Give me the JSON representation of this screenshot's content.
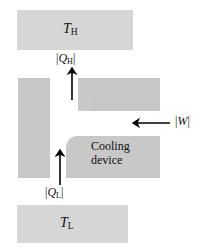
{
  "figure": {
    "type": "thermodynamics-schematic",
    "background_color": "#ffffff",
    "block_color": "#c8c8c8",
    "reservoir_color": "#d6d6d6",
    "channel_color": "#ffffff",
    "arrow_color": "#000000"
  },
  "reservoirs": {
    "hot": {
      "symbol": "T",
      "subscript": "H",
      "name": "hot-reservoir",
      "x": 17,
      "y": 10,
      "width": 116,
      "height": 40
    },
    "cold": {
      "symbol": "T",
      "subscript": "L",
      "name": "cold-reservoir",
      "x": 17,
      "y": 205,
      "width": 111,
      "height": 38
    }
  },
  "flows": {
    "heat_rejected": {
      "bar_open": "|",
      "symbol": "Q",
      "subscript": "H",
      "bar_close": "|",
      "direction": "up",
      "arrow_x": 72,
      "arrow_y_start": 100,
      "arrow_y_end": 68
    },
    "heat_absorbed": {
      "bar_open": "|",
      "symbol": "Q",
      "subscript": "L",
      "bar_close": "|",
      "direction": "up",
      "arrow_x": 60,
      "arrow_y_start": 185,
      "arrow_y_end": 150
    },
    "work_input": {
      "bar_open": "|",
      "symbol": "W",
      "bar_close": "|",
      "direction": "left",
      "arrow_x_start": 170,
      "arrow_x_end": 133,
      "arrow_y": 123
    }
  },
  "device": {
    "line1": "Cooling",
    "line2": "device"
  }
}
